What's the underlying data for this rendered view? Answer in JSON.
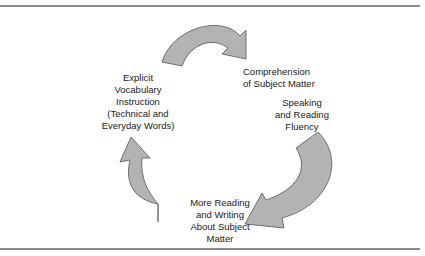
{
  "diagram": {
    "type": "cycle",
    "nodes": [
      {
        "id": "vocab",
        "label": "Explicit\nVocabulary\nInstruction\n(Technical and\nEveryday Words)"
      },
      {
        "id": "comprehension",
        "label": "Comprehension\nof Subject Matter"
      },
      {
        "id": "fluency",
        "label": "Speaking\nand Reading\nFluency"
      },
      {
        "id": "reading_writing",
        "label": "More Reading\nand Writing\nAbout Subject\nMatter"
      }
    ],
    "edges": [
      {
        "from": "vocab",
        "to": "comprehension",
        "shape": "curved-arrow"
      },
      {
        "from": "fluency",
        "to": "reading_writing",
        "shape": "curved-arrow"
      },
      {
        "from": "reading_writing",
        "to": "vocab",
        "shape": "curved-arrow"
      }
    ],
    "colors": {
      "arrow_fill": "#b3b3b3",
      "arrow_stroke": "#555555",
      "rule": "#8a8a8a",
      "text": "#1a1a1a"
    }
  }
}
